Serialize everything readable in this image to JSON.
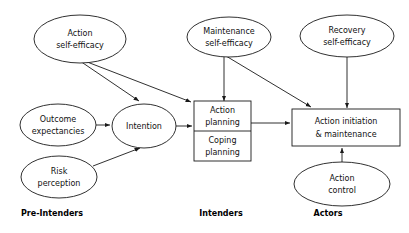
{
  "diagram": {
    "colors": {
      "stroke": "#1a1a1a",
      "text": "#111111",
      "background": "#ffffff"
    },
    "nodes": {
      "action_self_efficacy": {
        "line1": "Action",
        "line2": "self-efficacy",
        "shape": "ellipse"
      },
      "maintenance_self_efficacy": {
        "line1": "Maintenance",
        "line2": "self-efficacy",
        "shape": "ellipse"
      },
      "recovery_self_efficacy": {
        "line1": "Recovery",
        "line2": "self-efficacy",
        "shape": "ellipse"
      },
      "outcome_expectancies": {
        "line1": "Outcome",
        "line2": "expectancies",
        "shape": "ellipse"
      },
      "risk_perception": {
        "line1": "Risk",
        "line2": "perception",
        "shape": "ellipse"
      },
      "intention": {
        "line1": "Intention",
        "shape": "ellipse"
      },
      "action_planning": {
        "line1": "Action",
        "line2": "planning",
        "shape": "box"
      },
      "coping_planning": {
        "line1": "Coping",
        "line2": "planning",
        "shape": "box"
      },
      "action_initiation": {
        "line1": "Action initiation",
        "line2": "& maintenance",
        "shape": "box"
      },
      "action_control": {
        "line1": "Action",
        "line2": "control",
        "shape": "ellipse"
      }
    },
    "stage_labels": {
      "pre_intenders": "Pre-Intenders",
      "intenders": "Intenders",
      "actors": "Actors"
    }
  }
}
